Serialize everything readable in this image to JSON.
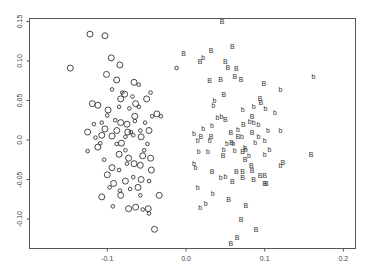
{
  "chart_data": {
    "type": "scatter",
    "title": "",
    "xlabel": "",
    "ylabel": "",
    "xlim": [
      -0.2,
      0.215
    ],
    "ylim": [
      -0.137,
      0.155
    ],
    "xticks": [
      -0.1,
      0.0,
      0.1,
      0.2
    ],
    "xtick_labels": [
      "-0.1",
      "0.0",
      "0.1",
      "0.2"
    ],
    "yticks": [
      -0.1,
      -0.05,
      0.0,
      0.05,
      0.1,
      0.15
    ],
    "ytick_labels": [
      "-0.10",
      "-0.05",
      "0.0",
      "0.05",
      "0.10",
      "0.15"
    ],
    "grid": false,
    "legend": null,
    "series": [
      {
        "name": "O (large circle)",
        "marker": "O",
        "points": [
          [
            -0.147,
            0.091
          ],
          [
            -0.122,
            0.134
          ],
          [
            -0.103,
            0.132
          ],
          [
            -0.095,
            0.104
          ],
          [
            -0.101,
            0.083
          ],
          [
            -0.084,
            0.095
          ],
          [
            -0.088,
            0.076
          ],
          [
            -0.078,
            0.058
          ],
          [
            -0.112,
            0.044
          ],
          [
            -0.099,
            0.038
          ],
          [
            -0.083,
            0.052
          ],
          [
            -0.074,
            0.01
          ],
          [
            -0.065,
            0.03
          ],
          [
            -0.088,
            0.012
          ],
          [
            -0.064,
            0.046
          ],
          [
            -0.112,
            -0.009
          ],
          [
            -0.103,
            0.014
          ],
          [
            -0.094,
            0.005
          ],
          [
            -0.082,
            -0.004
          ],
          [
            -0.075,
            0.02
          ],
          [
            -0.058,
            -0.032
          ],
          [
            -0.085,
            -0.018
          ],
          [
            -0.073,
            -0.023
          ],
          [
            -0.066,
            -0.03
          ],
          [
            -0.094,
            -0.035
          ],
          [
            -0.057,
            -0.05
          ],
          [
            -0.077,
            -0.052
          ],
          [
            -0.1,
            -0.044
          ],
          [
            -0.107,
            -0.072
          ],
          [
            -0.083,
            -0.07
          ],
          [
            -0.064,
            -0.085
          ],
          [
            -0.073,
            -0.087
          ],
          [
            -0.048,
            -0.087
          ],
          [
            -0.04,
            -0.113
          ],
          [
            -0.034,
            -0.07
          ],
          [
            -0.044,
            -0.038
          ],
          [
            -0.045,
            -0.023
          ],
          [
            -0.055,
            -0.02
          ],
          [
            -0.037,
            0.033
          ],
          [
            -0.066,
            0.073
          ],
          [
            -0.05,
            0.052
          ],
          [
            -0.047,
            0.012
          ],
          [
            -0.057,
            0.004
          ],
          [
            -0.125,
            0.01
          ],
          [
            -0.107,
            0.006
          ],
          [
            -0.061,
            -0.06
          ],
          [
            -0.119,
            0.046
          ],
          [
            -0.083,
            0.022
          ],
          [
            -0.092,
            -0.055
          ]
        ]
      },
      {
        "name": "o (small circle)",
        "marker": "o",
        "points": [
          [
            -0.012,
            0.091
          ],
          [
            -0.1,
            0.031
          ],
          [
            -0.107,
            0.022
          ],
          [
            -0.094,
            0.064
          ],
          [
            -0.085,
            0.042
          ],
          [
            -0.072,
            0.04
          ],
          [
            -0.065,
            0.024
          ],
          [
            -0.06,
            0.042
          ],
          [
            -0.052,
            0.022
          ],
          [
            -0.043,
            0.03
          ],
          [
            -0.067,
            0.006
          ],
          [
            -0.077,
            0.004
          ],
          [
            -0.088,
            -0.005
          ],
          [
            -0.058,
            0.012
          ],
          [
            -0.049,
            -0.005
          ],
          [
            -0.075,
            -0.03
          ],
          [
            -0.067,
            -0.047
          ],
          [
            -0.084,
            -0.064
          ],
          [
            -0.093,
            -0.084
          ],
          [
            -0.071,
            -0.062
          ],
          [
            -0.058,
            -0.07
          ],
          [
            -0.047,
            -0.052
          ],
          [
            -0.109,
            -0.004
          ],
          [
            -0.117,
            0.02
          ],
          [
            -0.125,
            -0.014
          ],
          [
            -0.047,
            -0.093
          ],
          [
            -0.055,
            -0.088
          ],
          [
            -0.07,
            0.01
          ],
          [
            -0.081,
            0.06
          ],
          [
            -0.06,
            0.07
          ],
          [
            -0.045,
            0.06
          ],
          [
            -0.032,
            0.03
          ],
          [
            -0.104,
            -0.025
          ],
          [
            -0.085,
            -0.038
          ],
          [
            -0.077,
            -0.013
          ],
          [
            -0.053,
            -0.013
          ],
          [
            -0.09,
            0.025
          ],
          [
            -0.068,
            0.055
          ],
          [
            -0.115,
            0.003
          ],
          [
            -0.097,
            -0.06
          ]
        ]
      },
      {
        "name": "B (uppercase)",
        "marker": "B",
        "points": [
          [
            0.046,
            0.15
          ],
          [
            -0.003,
            0.11
          ],
          [
            0.032,
            0.113
          ],
          [
            0.05,
            0.1
          ],
          [
            0.059,
            0.118
          ],
          [
            0.018,
            0.1
          ],
          [
            0.064,
            0.09
          ],
          [
            0.053,
            0.092
          ],
          [
            0.062,
            0.08
          ],
          [
            0.03,
            0.075
          ],
          [
            0.07,
            0.077
          ],
          [
            0.044,
            0.077
          ],
          [
            0.048,
            0.058
          ],
          [
            0.099,
            0.072
          ],
          [
            0.095,
            0.048
          ],
          [
            0.084,
            0.03
          ],
          [
            0.05,
            0.026
          ],
          [
            0.032,
            0.005
          ],
          [
            0.019,
            0.005
          ],
          [
            0.073,
            0.02
          ],
          [
            0.057,
            0.01
          ],
          [
            0.084,
            0.01
          ],
          [
            0.047,
            -0.02
          ],
          [
            0.058,
            -0.003
          ],
          [
            0.072,
            -0.015
          ],
          [
            0.075,
            -0.025
          ],
          [
            0.083,
            -0.032
          ],
          [
            0.064,
            -0.04
          ],
          [
            0.072,
            -0.04
          ],
          [
            0.072,
            -0.047
          ],
          [
            0.084,
            -0.038
          ],
          [
            0.086,
            -0.05
          ],
          [
            0.094,
            -0.045
          ],
          [
            0.1,
            -0.045
          ],
          [
            0.1,
            -0.055
          ],
          [
            0.059,
            -0.053
          ],
          [
            0.054,
            -0.075
          ],
          [
            0.076,
            -0.083
          ],
          [
            0.102,
            -0.055
          ],
          [
            0.123,
            -0.028
          ],
          [
            0.159,
            -0.018
          ],
          [
            0.07,
            -0.1
          ],
          [
            0.089,
            -0.113
          ],
          [
            0.065,
            -0.124
          ],
          [
            0.057,
            -0.131
          ],
          [
            0.033,
            -0.04
          ],
          [
            0.094,
            0.053
          ],
          [
            0.066,
            0.004
          ]
        ]
      },
      {
        "name": "b (lowercase)",
        "marker": "b",
        "points": [
          [
            0.162,
            0.08
          ],
          [
            0.12,
            0.064
          ],
          [
            0.022,
            0.105
          ],
          [
            0.036,
            0.05
          ],
          [
            0.035,
            0.044
          ],
          [
            0.072,
            0.038
          ],
          [
            0.086,
            0.042
          ],
          [
            0.101,
            0.04
          ],
          [
            0.113,
            0.035
          ],
          [
            0.04,
            0.028
          ],
          [
            0.045,
            0.03
          ],
          [
            0.081,
            0.023
          ],
          [
            0.086,
            0.022
          ],
          [
            0.092,
            0.02
          ],
          [
            0.022,
            0.015
          ],
          [
            0.033,
            0.018
          ],
          [
            0.066,
            0.013
          ],
          [
            0.104,
            0.012
          ],
          [
            0.12,
            0.012
          ],
          [
            0.01,
            0.008
          ],
          [
            0.015,
            0.0
          ],
          [
            0.03,
            0.0
          ],
          [
            0.052,
            -0.004
          ],
          [
            0.06,
            -0.004
          ],
          [
            0.071,
            0.004
          ],
          [
            0.088,
            -0.003
          ],
          [
            0.1,
            0.0
          ],
          [
            0.016,
            -0.014
          ],
          [
            0.028,
            -0.014
          ],
          [
            0.048,
            -0.012
          ],
          [
            0.062,
            -0.013
          ],
          [
            0.076,
            -0.012
          ],
          [
            0.1,
            -0.018
          ],
          [
            0.106,
            -0.012
          ],
          [
            0.12,
            -0.032
          ],
          [
            0.01,
            -0.03
          ],
          [
            0.012,
            -0.035
          ],
          [
            0.044,
            -0.048
          ],
          [
            0.05,
            -0.046
          ],
          [
            0.015,
            -0.06
          ],
          [
            0.034,
            -0.068
          ],
          [
            0.018,
            -0.085
          ],
          [
            0.025,
            -0.08
          ],
          [
            0.075,
            -0.01
          ],
          [
            0.092,
            0.005
          ],
          [
            0.08,
            -0.02
          ]
        ]
      }
    ]
  }
}
